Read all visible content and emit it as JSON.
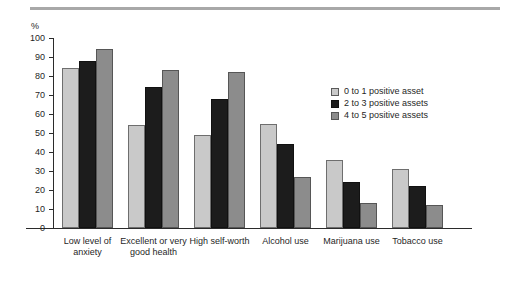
{
  "figure": {
    "background_color": "#ffffff",
    "rule_color": "#a8a8a8"
  },
  "axis": {
    "unit_label": "%",
    "tick_labels": [
      "100",
      "90",
      "80",
      "70",
      "60",
      "50",
      "40",
      "30",
      "20",
      "10",
      "0"
    ]
  },
  "legend": {
    "entries": [
      {
        "label": "0 to 1 positive asset",
        "color": "#c9c9c9",
        "swatch": "legend-swatch-light"
      },
      {
        "label": "2 to 3 positive assets",
        "color": "#1c1c1c",
        "swatch": "legend-swatch-dark"
      },
      {
        "label": "4 to 5 positive assets",
        "color": "#8c8c8c",
        "swatch": "legend-swatch-gray"
      }
    ]
  },
  "categories_display": [
    "Low level of\nanxiety",
    "Excellent or very\ngood health",
    "High self-worth",
    "Alcohol use",
    "Marijuana use",
    "Tobacco use"
  ],
  "chart_data": {
    "type": "bar",
    "title": "",
    "xlabel": "",
    "ylabel": "%",
    "ylim": [
      0,
      100
    ],
    "ytick_interval": 10,
    "grid": false,
    "legend_position": "upper-right",
    "categories": [
      "Low level of anxiety",
      "Excellent or very good health",
      "High self-worth",
      "Alcohol use",
      "Marijuana use",
      "Tobacco use"
    ],
    "series": [
      {
        "name": "0 to 1 positive asset",
        "color": "#c9c9c9",
        "values": [
          84,
          54,
          49,
          55,
          36,
          31
        ]
      },
      {
        "name": "2 to 3 positive assets",
        "color": "#1c1c1c",
        "values": [
          88,
          74,
          68,
          44,
          24,
          22
        ]
      },
      {
        "name": "4 to 5 positive assets",
        "color": "#8c8c8c",
        "values": [
          94,
          83,
          82,
          27,
          13,
          12
        ]
      }
    ]
  }
}
